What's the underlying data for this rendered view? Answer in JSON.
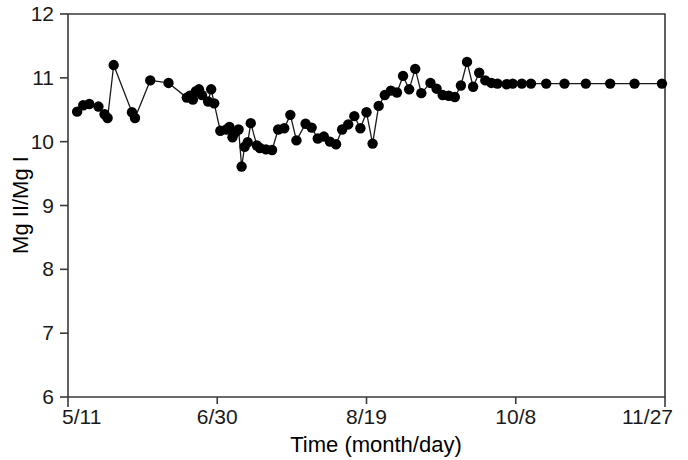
{
  "chart_data": {
    "type": "line",
    "title": "",
    "xlabel": "Time (month/day)",
    "ylabel": "Mg II/Mg I",
    "ylim": [
      6,
      12
    ],
    "ytick_labels": [
      "6",
      "7",
      "8",
      "9",
      "10",
      "11",
      "12"
    ],
    "ytick_values": [
      6,
      7,
      8,
      9,
      10,
      11,
      12
    ],
    "xlim_labels": [
      "5/11",
      "11/27"
    ],
    "xtick_labels": [
      "5/11",
      "6/30",
      "8/19",
      "10/8",
      "11/27"
    ],
    "xtick_positions": [
      0,
      49,
      98,
      147,
      196
    ],
    "x_axis_unit": "days since 5/11",
    "grid": false,
    "legend": null,
    "marker": "filled-circle",
    "series": [
      {
        "name": "Mg II/Mg I",
        "x": [
          3,
          5,
          7,
          10,
          12,
          13,
          15,
          21,
          22,
          27,
          33,
          39,
          40,
          41,
          42,
          43,
          44,
          46,
          47,
          48,
          50,
          52,
          53,
          54,
          55,
          56,
          57,
          58,
          59,
          60,
          62,
          63,
          65,
          67,
          69,
          71,
          73,
          75,
          78,
          80,
          82,
          84,
          86,
          88,
          90,
          92,
          94,
          96,
          98,
          100,
          102,
          104,
          106,
          108,
          110,
          112,
          114,
          116,
          119,
          121,
          123,
          125,
          127,
          129,
          131,
          133,
          135,
          137,
          139,
          141,
          144,
          146,
          149,
          152,
          157,
          163,
          170,
          178,
          186,
          195
        ],
        "y": [
          10.47,
          10.57,
          10.59,
          10.55,
          10.43,
          10.37,
          11.2,
          10.46,
          10.37,
          10.96,
          10.92,
          10.69,
          10.72,
          10.66,
          10.79,
          10.82,
          10.73,
          10.63,
          10.82,
          10.6,
          10.17,
          10.19,
          10.23,
          10.07,
          10.15,
          10.19,
          9.61,
          9.92,
          9.99,
          10.29,
          9.94,
          9.9,
          9.88,
          9.87,
          10.19,
          10.21,
          10.42,
          10.02,
          10.28,
          10.22,
          10.05,
          10.08,
          10.0,
          9.96,
          10.19,
          10.27,
          10.4,
          10.21,
          10.46,
          9.97,
          10.56,
          10.73,
          10.8,
          10.77,
          11.03,
          10.82,
          11.14,
          10.76,
          10.92,
          10.83,
          10.73,
          10.72,
          10.7,
          10.88,
          11.25,
          10.86,
          11.08,
          10.96,
          10.92,
          10.91,
          10.9,
          10.91,
          10.91,
          10.91,
          10.91,
          10.91,
          10.91,
          10.91,
          10.91,
          10.91
        ]
      }
    ]
  },
  "figure": {
    "y_axis_title": "Mg II/Mg I",
    "x_axis_title": "Time (month/day)",
    "y_ticks": [
      "12",
      "11",
      "10",
      "9",
      "8",
      "7",
      "6"
    ],
    "x_ticks": [
      "5/11",
      "6/30",
      "8/19",
      "10/8",
      "11/27"
    ]
  }
}
